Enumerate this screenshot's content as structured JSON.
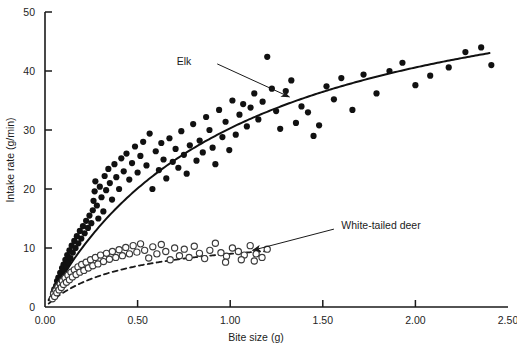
{
  "chart_data": {
    "type": "scatter",
    "title": "",
    "subtitle": "",
    "xlabel": "Bite size (g)",
    "ylabel": "Intake rate (g/min)",
    "xlim": [
      0.0,
      2.5
    ],
    "ylim": [
      0,
      50
    ],
    "xticks": [
      0.0,
      0.5,
      1.0,
      1.5,
      2.0,
      2.5
    ],
    "xticklabels": [
      "0.00",
      "0.50",
      "1.00",
      "1.50",
      "2.00",
      "2.50"
    ],
    "yticks": [
      0,
      10,
      20,
      30,
      40,
      50
    ],
    "yticklabels": [
      "0",
      "10",
      "20",
      "30",
      "40",
      "50"
    ],
    "grid": false,
    "legend_position": "inline-annotations",
    "frame": "left-and-bottom-spines-only",
    "annotations": [
      {
        "text": "Elk",
        "text_x": 0.79,
        "text_y": 41.6,
        "arrow_from_x": 0.93,
        "arrow_from_y": 41.2,
        "arrow_to_x": 1.32,
        "arrow_to_y": 35.6
      },
      {
        "text": "White-tailed deer",
        "text_x": 1.6,
        "text_y": 13.9,
        "arrow_from_x": 1.56,
        "arrow_from_y": 13.2,
        "arrow_to_x": 1.12,
        "arrow_to_y": 9.6
      }
    ],
    "series": [
      {
        "name": "Elk",
        "marker": "filled-circle",
        "marker_color": "#111111",
        "marker_size": 3.1,
        "curve_style": "solid",
        "curve_color": "#111111",
        "curve_width": 2.0,
        "model": "Holling type II: R = a*B/(b+B)",
        "curve_params": {
          "a": 61.5,
          "b": 1.03
        },
        "curve_x_range": [
          0.02,
          2.4
        ],
        "points": [
          [
            0.045,
            2.4
          ],
          [
            0.05,
            3.0
          ],
          [
            0.055,
            2.0
          ],
          [
            0.06,
            3.6
          ],
          [
            0.065,
            4.4
          ],
          [
            0.07,
            3.2
          ],
          [
            0.072,
            5.0
          ],
          [
            0.078,
            4.0
          ],
          [
            0.082,
            5.8
          ],
          [
            0.088,
            4.8
          ],
          [
            0.092,
            6.6
          ],
          [
            0.096,
            5.4
          ],
          [
            0.1,
            7.2
          ],
          [
            0.105,
            6.1
          ],
          [
            0.11,
            8.0
          ],
          [
            0.115,
            6.9
          ],
          [
            0.12,
            8.8
          ],
          [
            0.126,
            7.6
          ],
          [
            0.132,
            9.6
          ],
          [
            0.138,
            8.3
          ],
          [
            0.144,
            10.4
          ],
          [
            0.15,
            9.2
          ],
          [
            0.158,
            11.2
          ],
          [
            0.165,
            10.0
          ],
          [
            0.172,
            12.0
          ],
          [
            0.18,
            10.8
          ],
          [
            0.188,
            12.9
          ],
          [
            0.196,
            11.6
          ],
          [
            0.205,
            13.7
          ],
          [
            0.214,
            12.5
          ],
          [
            0.222,
            14.6
          ],
          [
            0.232,
            13.4
          ],
          [
            0.24,
            15.5
          ],
          [
            0.25,
            14.2
          ],
          [
            0.258,
            16.4
          ],
          [
            0.262,
            18.0
          ],
          [
            0.268,
            19.6
          ],
          [
            0.272,
            21.3
          ],
          [
            0.28,
            17.2
          ],
          [
            0.288,
            15.0
          ],
          [
            0.296,
            20.4
          ],
          [
            0.305,
            18.6
          ],
          [
            0.315,
            16.2
          ],
          [
            0.322,
            22.2
          ],
          [
            0.33,
            19.8
          ],
          [
            0.342,
            23.4
          ],
          [
            0.35,
            21.0
          ],
          [
            0.362,
            18.2
          ],
          [
            0.375,
            24.2
          ],
          [
            0.385,
            22.0
          ],
          [
            0.4,
            20.0
          ],
          [
            0.412,
            25.2
          ],
          [
            0.425,
            23.0
          ],
          [
            0.44,
            26.0
          ],
          [
            0.455,
            21.6
          ],
          [
            0.47,
            24.4
          ],
          [
            0.486,
            27.2
          ],
          [
            0.5,
            22.8
          ],
          [
            0.515,
            25.6
          ],
          [
            0.53,
            28.0
          ],
          [
            0.548,
            24.0
          ],
          [
            0.565,
            29.4
          ],
          [
            0.58,
            20.0
          ],
          [
            0.598,
            26.4
          ],
          [
            0.615,
            23.2
          ],
          [
            0.628,
            27.8
          ],
          [
            0.64,
            25.0
          ],
          [
            0.655,
            21.8
          ],
          [
            0.672,
            28.6
          ],
          [
            0.69,
            24.6
          ],
          [
            0.705,
            26.8
          ],
          [
            0.72,
            23.6
          ],
          [
            0.736,
            29.8
          ],
          [
            0.75,
            25.8
          ],
          [
            0.765,
            22.6
          ],
          [
            0.782,
            27.4
          ],
          [
            0.8,
            31.0
          ],
          [
            0.818,
            24.8
          ],
          [
            0.835,
            28.2
          ],
          [
            0.852,
            26.2
          ],
          [
            0.87,
            32.2
          ],
          [
            0.888,
            30.0
          ],
          [
            0.905,
            27.0
          ],
          [
            0.92,
            24.2
          ],
          [
            0.94,
            33.4
          ],
          [
            0.958,
            28.8
          ],
          [
            0.975,
            31.4
          ],
          [
            0.995,
            26.6
          ],
          [
            1.012,
            35.0
          ],
          [
            1.03,
            29.2
          ],
          [
            1.05,
            32.6
          ],
          [
            1.07,
            34.4
          ],
          [
            1.09,
            30.6
          ],
          [
            1.11,
            33.8
          ],
          [
            1.13,
            36.2
          ],
          [
            1.152,
            31.8
          ],
          [
            1.175,
            34.8
          ],
          [
            1.2,
            42.4
          ],
          [
            1.225,
            37.0
          ],
          [
            1.248,
            33.2
          ],
          [
            1.27,
            30.2
          ],
          [
            1.3,
            36.6
          ],
          [
            1.33,
            38.4
          ],
          [
            1.355,
            31.2
          ],
          [
            1.385,
            34.0
          ],
          [
            1.42,
            33.0
          ],
          [
            1.45,
            29.0
          ],
          [
            1.48,
            30.8
          ],
          [
            1.52,
            37.4
          ],
          [
            1.56,
            35.2
          ],
          [
            1.6,
            38.8
          ],
          [
            1.66,
            33.4
          ],
          [
            1.72,
            39.4
          ],
          [
            1.79,
            36.2
          ],
          [
            1.86,
            40.0
          ],
          [
            1.93,
            41.4
          ],
          [
            2.0,
            37.6
          ],
          [
            2.08,
            39.2
          ],
          [
            2.18,
            40.6
          ],
          [
            2.27,
            43.2
          ],
          [
            2.355,
            44.0
          ],
          [
            2.41,
            41.0
          ]
        ]
      },
      {
        "name": "White-tailed deer",
        "marker": "open-circle",
        "marker_color": "#3a3a3a",
        "marker_size": 3.1,
        "curve_style": "dashed",
        "curve_color": "#1a1a1a",
        "curve_width": 1.8,
        "model": "Holling type II: R = a*B/(b+B)",
        "curve_params": {
          "a": 12.8,
          "b": 0.42
        },
        "curve_x_range": [
          0.02,
          1.19
        ],
        "points": [
          [
            0.04,
            1.4
          ],
          [
            0.046,
            2.2
          ],
          [
            0.052,
            1.8
          ],
          [
            0.058,
            2.8
          ],
          [
            0.064,
            2.4
          ],
          [
            0.07,
            3.4
          ],
          [
            0.076,
            2.9
          ],
          [
            0.082,
            3.9
          ],
          [
            0.088,
            3.3
          ],
          [
            0.094,
            4.4
          ],
          [
            0.1,
            3.8
          ],
          [
            0.108,
            4.9
          ],
          [
            0.116,
            4.2
          ],
          [
            0.124,
            5.4
          ],
          [
            0.132,
            4.6
          ],
          [
            0.14,
            5.9
          ],
          [
            0.148,
            5.1
          ],
          [
            0.158,
            6.3
          ],
          [
            0.168,
            5.5
          ],
          [
            0.178,
            6.8
          ],
          [
            0.188,
            5.9
          ],
          [
            0.198,
            7.2
          ],
          [
            0.21,
            6.2
          ],
          [
            0.222,
            7.6
          ],
          [
            0.234,
            6.6
          ],
          [
            0.246,
            8.0
          ],
          [
            0.258,
            7.0
          ],
          [
            0.272,
            8.4
          ],
          [
            0.286,
            7.3
          ],
          [
            0.3,
            8.8
          ],
          [
            0.316,
            7.7
          ],
          [
            0.332,
            9.1
          ],
          [
            0.348,
            8.1
          ],
          [
            0.364,
            9.4
          ],
          [
            0.382,
            8.4
          ],
          [
            0.4,
            9.7
          ],
          [
            0.418,
            8.7
          ],
          [
            0.436,
            10.1
          ],
          [
            0.456,
            9.0
          ],
          [
            0.476,
            10.4
          ],
          [
            0.496,
            9.3
          ],
          [
            0.516,
            10.7
          ],
          [
            0.538,
            9.6
          ],
          [
            0.56,
            8.3
          ],
          [
            0.582,
            10.2
          ],
          [
            0.604,
            9.0
          ],
          [
            0.628,
            10.6
          ],
          [
            0.652,
            9.4
          ],
          [
            0.676,
            8.0
          ],
          [
            0.7,
            10.0
          ],
          [
            0.726,
            8.7
          ],
          [
            0.752,
            9.8
          ],
          [
            0.778,
            8.4
          ],
          [
            0.806,
            10.3
          ],
          [
            0.834,
            9.1
          ],
          [
            0.862,
            8.2
          ],
          [
            0.89,
            9.6
          ],
          [
            0.92,
            10.8
          ],
          [
            0.95,
            9.2
          ],
          [
            0.98,
            8.6
          ],
          [
            1.012,
            10.0
          ],
          [
            1.044,
            9.4
          ],
          [
            1.076,
            8.8
          ],
          [
            1.108,
            10.4
          ],
          [
            1.14,
            9.0
          ],
          [
            1.172,
            8.4
          ],
          [
            1.2,
            9.8
          ],
          [
            1.13,
            7.8
          ],
          [
            1.06,
            8.0
          ],
          [
            0.975,
            7.6
          ]
        ]
      }
    ]
  }
}
